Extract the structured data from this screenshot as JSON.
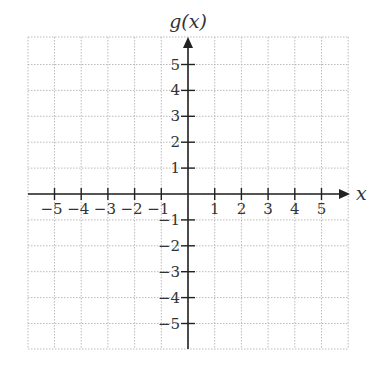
{
  "chart_data": {
    "type": "line",
    "title": "",
    "xlabel": "x",
    "ylabel": "g(x)",
    "xlim": [
      -6,
      6
    ],
    "ylim": [
      -6,
      6
    ],
    "x_ticks": [
      -5,
      -4,
      -3,
      -2,
      -1,
      1,
      2,
      3,
      4,
      5
    ],
    "y_ticks": [
      5,
      4,
      3,
      2,
      1,
      -1,
      -2,
      -3,
      -4,
      -5
    ],
    "x_tick_labels": [
      "−5",
      "−4",
      "−3",
      "−2",
      "−1",
      "1",
      "2",
      "3",
      "4",
      "5"
    ],
    "y_tick_labels": [
      "5",
      "4",
      "3",
      "2",
      "1",
      "−1",
      "−2",
      "−3",
      "−4",
      "−5"
    ],
    "grid": true,
    "grid_style": "dotted",
    "series": []
  },
  "colors": {
    "axis": "#222222",
    "grid": "#bbbbbb",
    "text": "#333333"
  }
}
